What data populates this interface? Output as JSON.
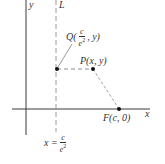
{
  "diagram": {
    "axes": {
      "y_label": "y",
      "x_label": "x"
    },
    "directrix": {
      "name": "L",
      "equation_lhs": "x =",
      "equation_num": "c",
      "equation_den": "e",
      "equation_den_exp": "2"
    },
    "points": {
      "Q": {
        "name": "Q",
        "open": "(",
        "num": "c",
        "den": "e",
        "den_exp": "2",
        "rest": ", y)"
      },
      "P": {
        "label": "P(x, y)"
      },
      "F": {
        "label": "F(c, 0)"
      }
    },
    "colors": {
      "axis": "#3a3a3a",
      "dashed": "#8a8a8a",
      "point": "#111111"
    }
  }
}
